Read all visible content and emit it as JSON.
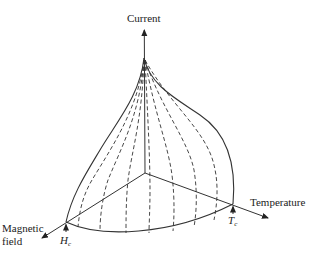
{
  "figure": {
    "type": "3d-critical-surface",
    "axes": {
      "vertical": {
        "label": "Current"
      },
      "right": {
        "label": "Temperature"
      },
      "left": {
        "label_line1": "Magnetic",
        "label_line2": "field"
      }
    },
    "markers": {
      "critical_field": {
        "symbol": "H",
        "subscript": "c"
      },
      "critical_temperature": {
        "symbol": "T",
        "subscript": "c"
      }
    },
    "colors": {
      "line": "#333333",
      "background": "#ffffff"
    },
    "dashed_curve_count": 7
  }
}
